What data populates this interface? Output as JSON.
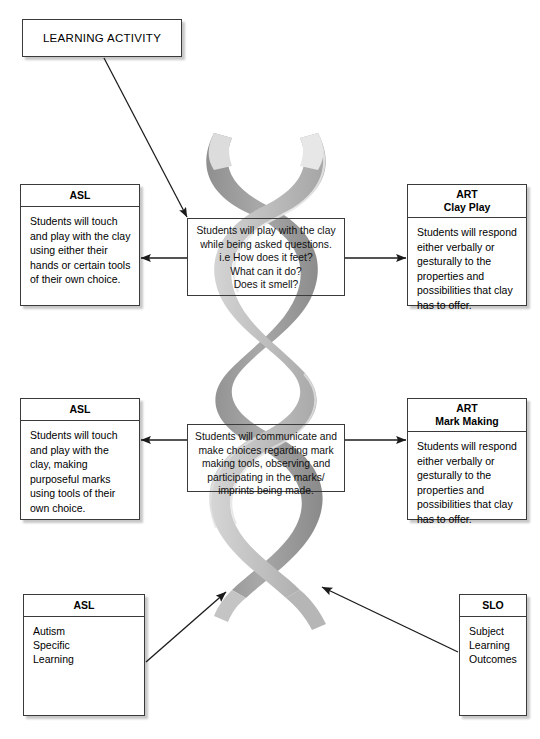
{
  "title_box": {
    "label": "LEARNING ACTIVITY"
  },
  "boxes": [
    {
      "name": "asl-top",
      "header": "ASL",
      "subheader": "",
      "body": "Students will touch and play with the clay using either their hands or certain tools of their own choice."
    },
    {
      "name": "art-top",
      "header": "ART",
      "subheader": "Clay Play",
      "body": "Students will respond either verbally or gesturally to the properties and possibilities that clay has to offer."
    },
    {
      "name": "asl-mid",
      "header": "ASL",
      "subheader": "",
      "body": "Students will touch and play with the clay, making purposeful marks using tools of their own choice."
    },
    {
      "name": "art-mid",
      "header": "ART",
      "subheader": "Mark Making",
      "body": "Students will respond either verbally or gesturally to the properties and possibilities that clay has to offer."
    },
    {
      "name": "asl-bottom",
      "header": "ASL",
      "subheader": "",
      "body": "Autism\nSpecific\nLearning"
    },
    {
      "name": "slo-bottom",
      "header": "SLO",
      "subheader": "",
      "body": "Subject\nLearning\nOutcomes"
    }
  ],
  "process_boxes": [
    {
      "name": "proc-top",
      "lines": [
        "Students will play with the clay",
        "while being asked questions.",
        "i.e How does it feet?",
        "What can it do?",
        "Does it smell?"
      ]
    },
    {
      "name": "proc-mid",
      "lines": [
        "Students will communicate and",
        "make choices regarding mark",
        "making tools, observing and",
        "participating in the marks/",
        "imprints being made."
      ]
    }
  ],
  "graphic": {
    "name": "dna-helix",
    "description": "grey double helix ribbon",
    "ribbon_light": "#c9c9c9",
    "ribbon_mid": "#b0b0b0",
    "ribbon_dark": "#939393",
    "ribbon_edge": "#e4e4e4"
  },
  "connectors": [
    {
      "name": "title-to-process-top",
      "style": "arrow"
    },
    {
      "name": "process-top-to-asl",
      "style": "arrow"
    },
    {
      "name": "process-top-to-art",
      "style": "arrow"
    },
    {
      "name": "process-mid-to-asl",
      "style": "arrow"
    },
    {
      "name": "process-mid-to-art",
      "style": "arrow"
    },
    {
      "name": "asl-bottom-to-helix",
      "style": "arrow"
    },
    {
      "name": "slo-bottom-to-helix",
      "style": "arrow"
    }
  ],
  "colors": {
    "line": "#1b1b1b",
    "border": "#3a3a3a",
    "background": "#ffffff"
  }
}
